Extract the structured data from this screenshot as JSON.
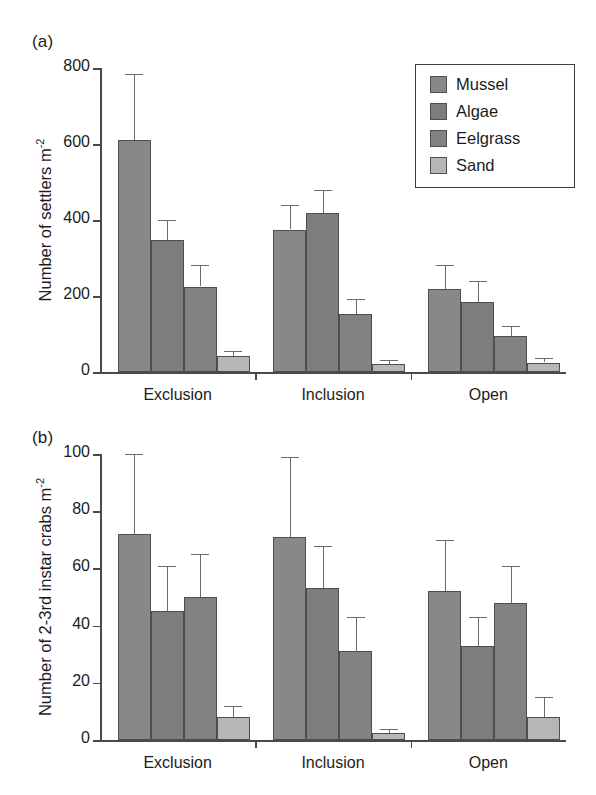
{
  "figure": {
    "panel_a_label": "(a)",
    "panel_b_label": "(b)"
  },
  "legend": {
    "position": "top-right",
    "entries": [
      {
        "label": "Mussel",
        "color": "#888888"
      },
      {
        "label": "Algae",
        "color": "#7d7d7d"
      },
      {
        "label": "Eelgrass",
        "color": "#828282"
      },
      {
        "label": "Sand",
        "color": "#b6b6b6"
      }
    ]
  },
  "chart_data": [
    {
      "type": "bar",
      "panel": "(a)",
      "title": "",
      "xlabel": "",
      "ylabel": "Number of settlers m⁻²",
      "ylabel_base": "Number of settlers m",
      "ylabel_exp": "-2",
      "categories": [
        "Exclusion",
        "Inclusion",
        "Open"
      ],
      "ylim": [
        0,
        800
      ],
      "yticks": [
        0,
        200,
        400,
        600,
        800
      ],
      "ytick_labels": [
        "0",
        "200",
        "400",
        "600",
        "800"
      ],
      "grid": false,
      "error_type": "error bars (upper only)",
      "series": [
        {
          "name": "Mussel",
          "color": "#888888",
          "values": [
            610,
            375,
            218
          ],
          "errors_upper": [
            785,
            440,
            282
          ]
        },
        {
          "name": "Algae",
          "color": "#7d7d7d",
          "values": [
            348,
            418,
            185
          ],
          "errors_upper": [
            400,
            478,
            240
          ]
        },
        {
          "name": "Eelgrass",
          "color": "#828282",
          "values": [
            225,
            153,
            95
          ],
          "errors_upper": [
            282,
            192,
            120
          ]
        },
        {
          "name": "Sand",
          "color": "#b6b6b6",
          "values": [
            42,
            22,
            25
          ],
          "errors_upper": [
            55,
            32,
            38
          ]
        }
      ]
    },
    {
      "type": "bar",
      "panel": "(b)",
      "title": "",
      "xlabel": "",
      "ylabel": "Number of 2-3rd instar crabs m⁻²",
      "ylabel_base": "Number of 2-3rd instar crabs m",
      "ylabel_exp": "-2",
      "categories": [
        "Exclusion",
        "Inclusion",
        "Open"
      ],
      "ylim": [
        0,
        100
      ],
      "yticks": [
        0,
        20,
        40,
        60,
        80,
        100
      ],
      "ytick_labels": [
        "0",
        "20",
        "40",
        "60",
        "80",
        "100"
      ],
      "grid": false,
      "error_type": "error bars (upper only)",
      "series": [
        {
          "name": "Mussel",
          "color": "#888888",
          "values": [
            72,
            71,
            52
          ],
          "errors_upper": [
            100,
            99,
            70
          ]
        },
        {
          "name": "Algae",
          "color": "#7d7d7d",
          "values": [
            45,
            53,
            33
          ],
          "errors_upper": [
            61,
            68,
            43
          ]
        },
        {
          "name": "Eelgrass",
          "color": "#828282",
          "values": [
            50,
            31,
            48
          ],
          "errors_upper": [
            65,
            43,
            61
          ]
        },
        {
          "name": "Sand",
          "color": "#b6b6b6",
          "values": [
            8,
            2.5,
            8
          ],
          "errors_upper": [
            12,
            4,
            15
          ]
        }
      ]
    }
  ]
}
